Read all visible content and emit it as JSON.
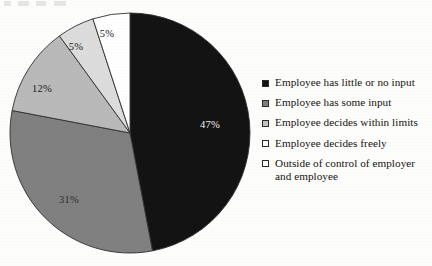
{
  "chart_data": {
    "type": "pie",
    "title": "",
    "subtitle": "",
    "xlabel": "",
    "ylabel": "",
    "grid": false,
    "legend_position": "right",
    "start_angle_deg": 0,
    "direction": "clockwise",
    "categories": [
      "Employee has little or no input",
      "Employee has some input",
      "Employee decides within limits",
      "Employee decides freely",
      "Outside of control of employer and employee"
    ],
    "values": [
      47,
      31,
      12,
      5,
      5
    ],
    "value_labels": [
      "47%",
      "31%",
      "12%",
      "5%",
      "5%"
    ],
    "colors": [
      "#131313",
      "#808080",
      "#b9b9b9",
      "#dcdcdc",
      "#ffffff"
    ],
    "label_text_colors": [
      "#ffffff",
      "#2b2b2b",
      "#1a1a1a",
      "#1a1a1a",
      "#1a1a1a"
    ],
    "slice_border_color": "#2f2f2f",
    "units": "percent"
  },
  "pie": {
    "center_x": 130,
    "center_y": 133,
    "radius": 120,
    "slices": [
      {
        "name": "Employee has little or no input",
        "value": 47,
        "label": "47%",
        "color": "#131313",
        "label_color": "#f2f2f2",
        "label_x": 210,
        "label_y": 128
      },
      {
        "name": "Employee has some input",
        "value": 31,
        "label": "31%",
        "color": "#808080",
        "label_color": "#2f2f2f",
        "label_x": 69,
        "label_y": 203
      },
      {
        "name": "Employee decides within limits",
        "value": 12,
        "label": "12%",
        "color": "#b9b9b9",
        "label_color": "#1a1a1a",
        "label_x": 42,
        "label_y": 92
      },
      {
        "name": "Employee decides freely",
        "value": 5,
        "label": "5%",
        "color": "#dcdcdc",
        "label_color": "#1a1a1a",
        "label_x": 76,
        "label_y": 50
      },
      {
        "name": "Outside of control of employer and employee",
        "value": 5,
        "label": "5%",
        "color": "#ffffff",
        "label_color": "#1a1a1a",
        "label_x": 107,
        "label_y": 37
      }
    ]
  },
  "legend": {
    "items": [
      {
        "label": "Employee has little or no input",
        "swatch_color": "#131313"
      },
      {
        "label": "Employee has some input",
        "swatch_color": "#7f7f7f"
      },
      {
        "label": "Employee decides within limits",
        "swatch_color": "#c4c4c4"
      },
      {
        "label": "Employee decides freely",
        "swatch_color": "#ffffff"
      },
      {
        "label": "Outside of control of employer\nand employee",
        "swatch_color": "#ffffff"
      }
    ]
  }
}
